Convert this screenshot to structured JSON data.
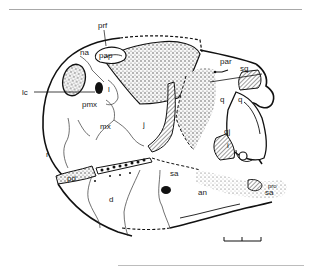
{
  "figure": {
    "labels": {
      "prf": "prf",
      "pap": "pap",
      "na": "na",
      "lc": "lc",
      "pmx": "pmx",
      "l": "l",
      "mx": "mx",
      "j": "j",
      "r": "r",
      "pd": "pd",
      "d": "d",
      "sa_mid": "sa",
      "an": "an",
      "par": "par",
      "sq": "sq",
      "q_inner": "q",
      "q_outer": "q",
      "qj": "qj",
      "i": "i",
      "pro": "pro",
      "sa_rear": "sa"
    },
    "scale_bar": {
      "segments": 2
    }
  }
}
